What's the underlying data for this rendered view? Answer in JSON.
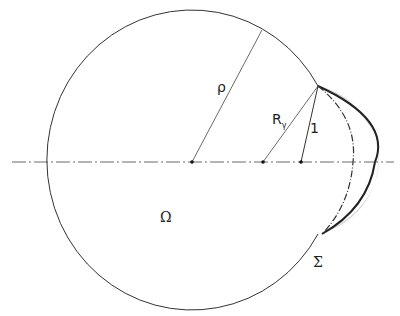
{
  "diagram": {
    "labels": {
      "rho": "ρ",
      "r_gamma_main": "R",
      "r_gamma_sub": "γ",
      "one": "1",
      "omega": "Ω",
      "sigma": "Σ"
    },
    "colors": {
      "line": "#333333",
      "crescent_fill": "#d9d9d9",
      "background": "#ffffff"
    }
  }
}
